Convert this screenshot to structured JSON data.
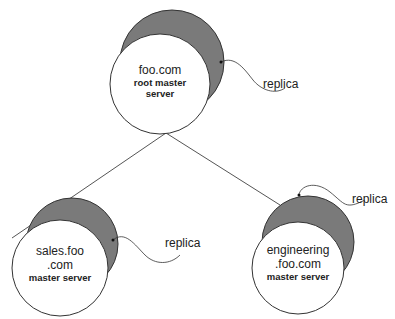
{
  "diagram": {
    "nodes": [
      {
        "id": "root",
        "name_lines": [
          "foo.com"
        ],
        "role_lines": [
          "root master",
          "server"
        ]
      },
      {
        "id": "sales",
        "name_lines": [
          "sales.foo",
          ".com"
        ],
        "role_lines": [
          "master server"
        ]
      },
      {
        "id": "engineering",
        "name_lines": [
          "engineering",
          ".foo.com"
        ],
        "role_lines": [
          "master server"
        ]
      }
    ],
    "replica_label": "replica",
    "replicas": [
      {
        "of": "root",
        "label": "replica"
      },
      {
        "of": "sales",
        "label": "replica"
      },
      {
        "of": "engineering",
        "label": "replica"
      }
    ],
    "edges": [
      {
        "from": "root",
        "to": "sales"
      },
      {
        "from": "root",
        "to": "engineering"
      }
    ],
    "colors": {
      "replica_fill": "#7a7a7a",
      "outline": "#333333",
      "background": "#ffffff"
    }
  }
}
